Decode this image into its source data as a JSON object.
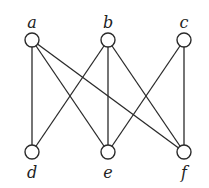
{
  "graph": {
    "type": "bipartite",
    "nodes": [
      {
        "id": "a",
        "label": "a",
        "x": 32,
        "y": 40,
        "label_pos": "above"
      },
      {
        "id": "b",
        "label": "b",
        "x": 108,
        "y": 40,
        "label_pos": "above"
      },
      {
        "id": "c",
        "label": "c",
        "x": 184,
        "y": 40,
        "label_pos": "above"
      },
      {
        "id": "d",
        "label": "d",
        "x": 32,
        "y": 152,
        "label_pos": "below"
      },
      {
        "id": "e",
        "label": "e",
        "x": 108,
        "y": 152,
        "label_pos": "below"
      },
      {
        "id": "f",
        "label": "f",
        "x": 184,
        "y": 152,
        "label_pos": "below"
      }
    ],
    "edges": [
      [
        "a",
        "d"
      ],
      [
        "a",
        "e"
      ],
      [
        "a",
        "f"
      ],
      [
        "b",
        "d"
      ],
      [
        "b",
        "e"
      ],
      [
        "b",
        "f"
      ],
      [
        "c",
        "e"
      ],
      [
        "c",
        "f"
      ]
    ],
    "node_radius": 7,
    "colors": {
      "stroke": "#2a2a2a",
      "fill": "#ffffff",
      "background": "#ffffff"
    }
  }
}
